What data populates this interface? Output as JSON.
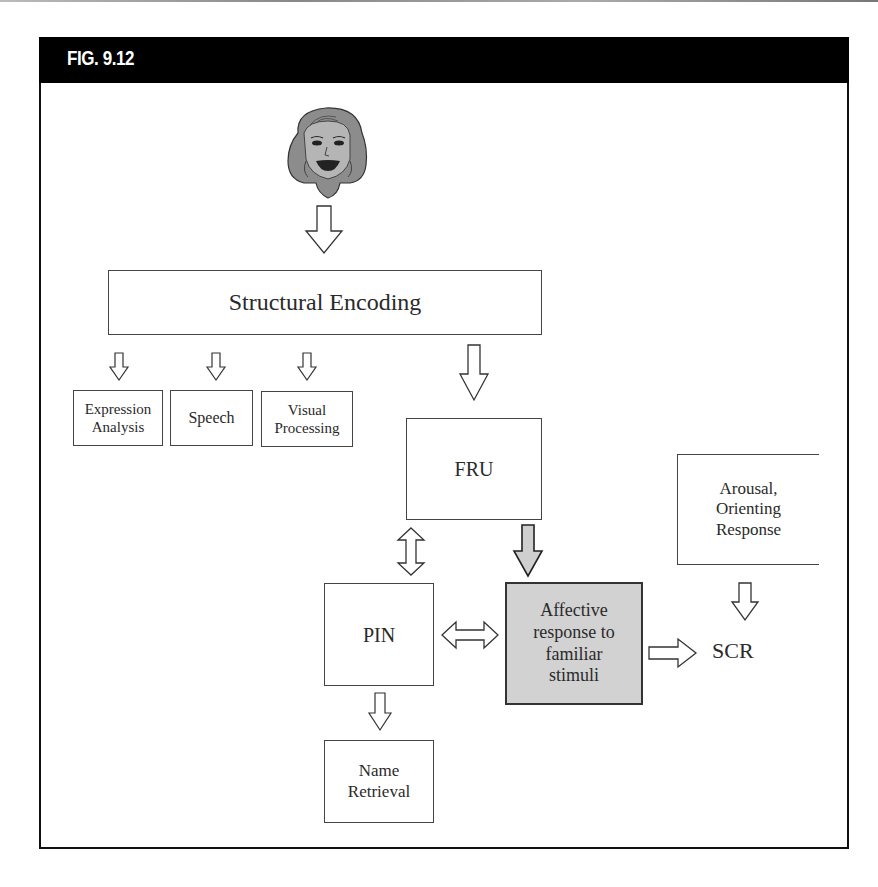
{
  "figure": {
    "title": "FIG. 9.12"
  },
  "nodes": {
    "face": {
      "label": "face-stimulus"
    },
    "structural_encoding": {
      "label": "Structural Encoding"
    },
    "expression_analysis": {
      "label": "Expression\nAnalysis"
    },
    "speech": {
      "label": "Speech"
    },
    "visual_processing": {
      "label": "Visual\nProcessing"
    },
    "fru": {
      "label": "FRU"
    },
    "arousal": {
      "label": "Arousal,\nOrienting\nResponse"
    },
    "pin": {
      "label": "PIN"
    },
    "affective": {
      "label": "Affective\nresponse to\nfamiliar\nstimuli"
    },
    "scr": {
      "label": "SCR"
    },
    "name_retrieval": {
      "label": "Name\nRetrieval"
    }
  },
  "edges": [
    {
      "from": "face",
      "to": "Structural Encoding",
      "type": "down-arrow"
    },
    {
      "from": "Structural Encoding",
      "to": "Expression Analysis",
      "type": "down-arrow"
    },
    {
      "from": "Structural Encoding",
      "to": "Speech",
      "type": "down-arrow"
    },
    {
      "from": "Structural Encoding",
      "to": "Visual Processing",
      "type": "down-arrow"
    },
    {
      "from": "Structural Encoding",
      "to": "FRU",
      "type": "down-arrow"
    },
    {
      "from": "FRU",
      "to": "PIN",
      "type": "bidirectional-vertical"
    },
    {
      "from": "FRU",
      "to": "Affective response to familiar stimuli",
      "type": "down-arrow-gray"
    },
    {
      "from": "PIN",
      "to": "Affective response to familiar stimuli",
      "type": "bidirectional-horizontal"
    },
    {
      "from": "Affective response to familiar stimuli",
      "to": "SCR",
      "type": "right-arrow"
    },
    {
      "from": "Arousal, Orienting Response",
      "to": "SCR",
      "type": "down-arrow"
    },
    {
      "from": "PIN",
      "to": "Name Retrieval",
      "type": "down-arrow"
    }
  ],
  "colors": {
    "header_bg": "#000000",
    "header_text": "#ffffff",
    "affective_fill": "#d2d2d2",
    "gray_arrow_fill": "#cfcfcf"
  }
}
